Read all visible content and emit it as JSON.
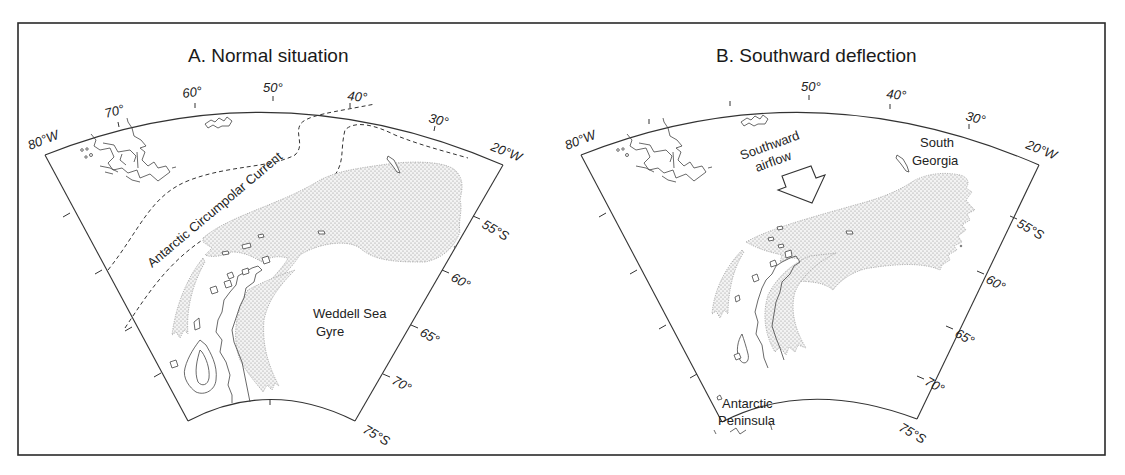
{
  "figure": {
    "panels": [
      {
        "id": "A",
        "title": "A.  Normal situation",
        "longitude_labels": [
          "80°W",
          "70°",
          "60°",
          "50°",
          "40°",
          "30°",
          "20°W"
        ],
        "latitude_labels": [
          "55°S",
          "60°",
          "65°",
          "70°",
          "75°S"
        ],
        "annotations": {
          "current": "Antarctic Circumpolar Current",
          "gyre_line1": "Weddell Sea",
          "gyre_line2": "Gyre"
        }
      },
      {
        "id": "B",
        "title": "B.  Southward deflection",
        "longitude_labels": [
          "80°W",
          "50°",
          "40°",
          "30°",
          "20°W"
        ],
        "latitude_labels": [
          "55°S",
          "60°",
          "65°",
          "70°",
          "75°S"
        ],
        "annotations": {
          "airflow_line1": "Southward",
          "airflow_line2": "airflow",
          "island_line1": "South",
          "island_line2": "Georgia",
          "peninsula_line1": "Antarctic",
          "peninsula_line2": "Peninsula"
        }
      }
    ],
    "legend": {
      "stipple": "stippled-region",
      "dashed": "current-boundary"
    },
    "colors": {
      "frame": "#2a2a2a",
      "line": "#333333",
      "stipple": "#8a8a8a",
      "background": "#ffffff"
    }
  }
}
